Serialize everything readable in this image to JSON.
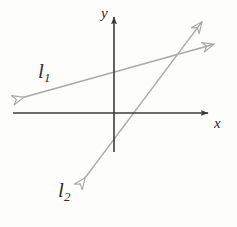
{
  "figure": {
    "background_color": "#fdfdfc",
    "width": 237,
    "height": 227
  },
  "axes": {
    "x_axis": {
      "label": "x",
      "color": "#3b3b3b",
      "y_position": 113,
      "start_x": 13,
      "end_x": 215,
      "arrow": "right"
    },
    "y_axis": {
      "label": "y",
      "color": "#3b3b3b",
      "x_position": 114,
      "start_y": 152,
      "end_y": 10,
      "arrow": "up"
    },
    "origin": {
      "x": 114,
      "y": 113
    }
  },
  "lines": [
    {
      "id": "l1",
      "label": "l",
      "subscript": "1",
      "color": "#a9a9a9",
      "arrows": "both",
      "from": {
        "x": 14,
        "y": 100
      },
      "to": {
        "x": 222,
        "y": 42
      },
      "y_intercept_px": 77,
      "description": "shallow positive slope line"
    },
    {
      "id": "l2",
      "label": "l",
      "subscript": "2",
      "color": "#a9a9a9",
      "arrows": "both",
      "from": {
        "x": 79,
        "y": 186
      },
      "to": {
        "x": 207,
        "y": 15
      },
      "x_intercept_px": 130,
      "description": "steep positive slope line"
    }
  ],
  "intersection": {
    "x": 172,
    "y": 57
  }
}
